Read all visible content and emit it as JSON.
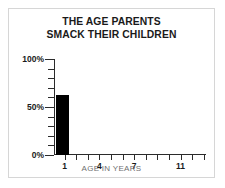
{
  "card": {
    "border_color": "#d6d6d6",
    "background": "#ffffff"
  },
  "chart_data": {
    "type": "bar",
    "title": "THE AGE PARENTS SMACK THEIR CHILDREN",
    "title_lines": [
      "THE AGE PARENTS",
      "SMACK THEIR CHILDREN"
    ],
    "xlabel": "AGE IN YEARS",
    "ylabel": "",
    "categories": [
      "1",
      "2",
      "3",
      "4",
      "5",
      "6",
      "7",
      "8",
      "9",
      "10",
      "11",
      "12",
      "13"
    ],
    "values": [
      62,
      0,
      0,
      0,
      0,
      0,
      0,
      0,
      0,
      0,
      0,
      0,
      0
    ],
    "bar_color": "#000000",
    "ylim": [
      0,
      100
    ],
    "y_ticks": [
      0,
      10,
      20,
      30,
      40,
      50,
      60,
      70,
      80,
      90,
      100
    ],
    "y_tick_labels": [
      "0%",
      "",
      "",
      "",
      "",
      "50%",
      "",
      "",
      "",
      "",
      "100%"
    ],
    "y_major_labels": [
      "0%",
      "50%",
      "100%"
    ],
    "x_tick_labels": [
      "1",
      "",
      "",
      "4",
      "",
      "",
      "7",
      "",
      "",
      "",
      "11",
      "",
      ""
    ],
    "x_major_labels": [
      "1",
      "4",
      "7",
      "11"
    ],
    "grid": false,
    "legend": false
  }
}
